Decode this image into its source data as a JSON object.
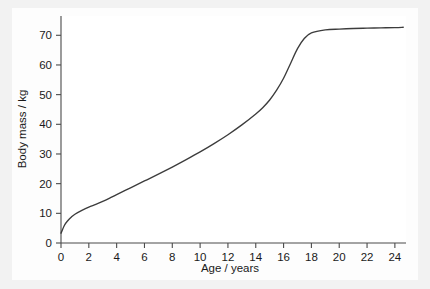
{
  "chart_data": {
    "type": "line",
    "title": "",
    "subtitle": "",
    "xlabel": "Age / years",
    "ylabel": "Body mass / kg",
    "xlim": [
      0,
      24.8
    ],
    "ylim": [
      0,
      76.5
    ],
    "grid": false,
    "legend": null,
    "legend_position": "none",
    "x_ticks": [
      0,
      2,
      4,
      6,
      8,
      10,
      12,
      14,
      16,
      18,
      20,
      22,
      24
    ],
    "x_tick_labels": [
      "0",
      "2",
      "4",
      "6",
      "8",
      "10",
      "12",
      "14",
      "16",
      "18",
      "20",
      "22",
      "24"
    ],
    "y_ticks": [
      0,
      10,
      20,
      30,
      40,
      50,
      60,
      70
    ],
    "y_tick_labels": [
      "0",
      "10",
      "20",
      "30",
      "40",
      "50",
      "60",
      "70"
    ],
    "line_color": "#3c3c3c",
    "series": [
      {
        "name": "Body mass",
        "x": [
          0,
          0.25,
          0.5,
          0.75,
          1,
          1.5,
          2,
          2.5,
          3,
          3.5,
          4,
          5,
          6,
          7,
          8,
          9,
          10,
          11,
          12,
          13,
          14,
          14.5,
          15,
          15.5,
          16,
          16.5,
          17,
          17.5,
          18,
          19,
          20,
          21,
          22,
          23,
          24,
          24.6
        ],
        "y": [
          3.3,
          6.0,
          7.6,
          8.8,
          9.7,
          11.0,
          12.1,
          13.0,
          14.0,
          15.1,
          16.3,
          18.6,
          20.9,
          23.2,
          25.6,
          28.1,
          30.7,
          33.5,
          36.5,
          39.8,
          43.5,
          45.6,
          48.2,
          51.5,
          55.5,
          60.5,
          65.5,
          69.0,
          70.8,
          71.8,
          72.1,
          72.3,
          72.4,
          72.5,
          72.6,
          72.7
        ],
        "color": "#3c3c3c"
      }
    ],
    "annotations": [],
    "notable_values": {
      "birth_mass_kg": 3.3,
      "plateau_mass_kg": 72.7,
      "growth_spurt_start_age": 13,
      "growth_spurt_end_age": 17.5
    }
  }
}
